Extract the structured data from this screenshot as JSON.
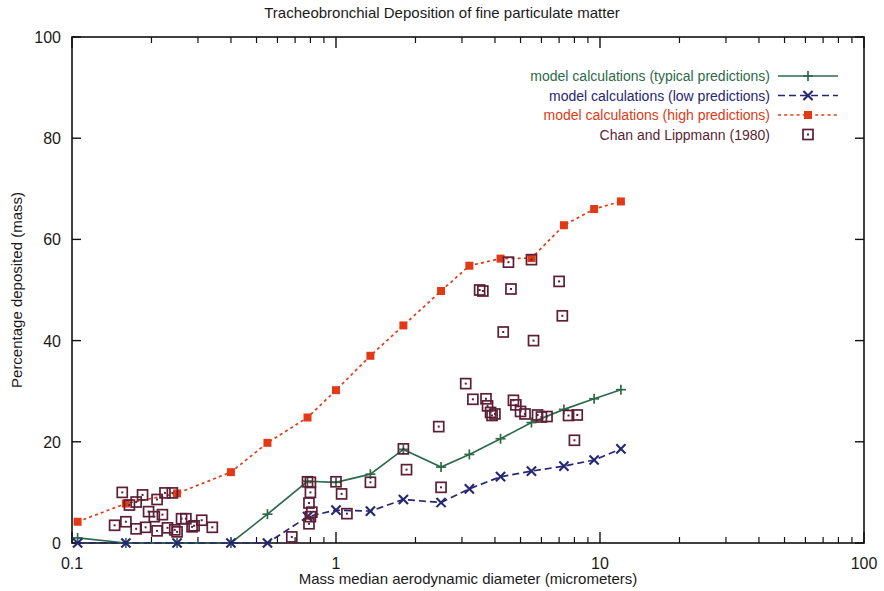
{
  "chart_data": {
    "type": "scatter",
    "title": "Tracheobronchial Deposition of fine particulate matter",
    "xlabel": "Mass median aerodynamic diameter (micrometers)",
    "ylabel": "Percentage deposited (mass)",
    "xscale": "log",
    "yscale": "linear",
    "xlim": [
      0.1,
      100
    ],
    "ylim": [
      0,
      100
    ],
    "xticks": [
      "0.1",
      "1",
      "10",
      "100"
    ],
    "xtick_values": [
      0.1,
      1,
      10,
      100
    ],
    "yticks": [
      "0",
      "20",
      "40",
      "60",
      "80",
      "100"
    ],
    "ytick_values": [
      0,
      20,
      40,
      60,
      80,
      100
    ],
    "grid": false,
    "legend_position": "top-right",
    "series": [
      {
        "name": "model calculations (typical predictions)",
        "color": "#2d6a4a",
        "style": "solid",
        "marker": "plus",
        "x": [
          0.105,
          0.16,
          0.25,
          0.4,
          0.55,
          0.78,
          1.0,
          1.35,
          1.8,
          2.5,
          3.2,
          4.2,
          5.5,
          7.3,
          9.5,
          12.0
        ],
        "y": [
          1.0,
          0.0,
          0.0,
          0.0,
          5.7,
          12.2,
          12.0,
          13.6,
          18.5,
          15.0,
          17.5,
          20.6,
          23.8,
          26.4,
          28.5,
          30.3
        ]
      },
      {
        "name": "model calculations (low predictions)",
        "color": "#262673",
        "style": "dashed",
        "marker": "cross",
        "x": [
          0.105,
          0.16,
          0.25,
          0.4,
          0.55,
          0.78,
          1.0,
          1.35,
          1.8,
          2.5,
          3.2,
          4.2,
          5.5,
          7.3,
          9.5,
          12.0
        ],
        "y": [
          0.0,
          0.0,
          0.0,
          0.0,
          0.0,
          5.2,
          6.5,
          6.3,
          8.6,
          8.0,
          10.7,
          13.1,
          14.2,
          15.2,
          16.4,
          18.6
        ]
      },
      {
        "name": "model calculations (high predictions)",
        "color": "#e03a16",
        "style": "dotted",
        "marker": "filled-square",
        "x": [
          0.105,
          0.16,
          0.25,
          0.4,
          0.55,
          0.78,
          1.0,
          1.35,
          1.8,
          2.5,
          3.2,
          4.2,
          5.5,
          7.3,
          9.5,
          12.0
        ],
        "y": [
          4.2,
          7.8,
          9.8,
          14.0,
          19.8,
          24.8,
          30.2,
          37.0,
          43.0,
          49.8,
          54.8,
          56.2,
          56.3,
          62.8,
          66.0,
          67.5
        ]
      },
      {
        "name": "Chan and Lippmann (1980)",
        "color": "#5c1f35",
        "style": "none",
        "marker": "open-square",
        "x": [
          0.155,
          0.165,
          0.175,
          0.185,
          0.195,
          0.21,
          0.225,
          0.24,
          0.145,
          0.16,
          0.175,
          0.19,
          0.21,
          0.23,
          0.25,
          0.27,
          0.29,
          0.205,
          0.22,
          0.245,
          0.26,
          0.285,
          0.31,
          0.34,
          0.78,
          0.8,
          0.8,
          0.79,
          0.81,
          0.8,
          0.79,
          1.0,
          1.05,
          1.1,
          1.35,
          1.8,
          1.85,
          2.45,
          2.5,
          3.1,
          3.3,
          3.5,
          3.6,
          3.7,
          3.75,
          3.85,
          3.9,
          4.0,
          4.3,
          4.5,
          4.6,
          4.7,
          4.8,
          5.0,
          5.2,
          5.5,
          5.6,
          5.8,
          6.0,
          6.3,
          7.0,
          7.2,
          7.6,
          8.0,
          8.2,
          0.68
        ],
        "y": [
          10.0,
          7.5,
          8.1,
          9.5,
          6.2,
          8.6,
          9.9,
          9.9,
          3.5,
          4.2,
          2.8,
          3.1,
          2.4,
          3.0,
          2.2,
          4.8,
          3.4,
          5.2,
          5.6,
          2.6,
          4.8,
          3.2,
          4.5,
          3.1,
          12.1,
          12.0,
          10.0,
          7.9,
          6.1,
          5.2,
          3.8,
          12.1,
          9.7,
          5.8,
          12.0,
          18.6,
          14.5,
          23.0,
          11.0,
          31.5,
          28.4,
          50.0,
          49.8,
          28.5,
          27.1,
          25.8,
          25.2,
          25.5,
          41.7,
          55.5,
          50.2,
          28.2,
          27.3,
          26.0,
          25.5,
          56.0,
          40.0,
          25.3,
          24.9,
          25.0,
          51.7,
          44.9,
          25.2,
          20.3,
          25.3,
          1.2
        ]
      }
    ]
  },
  "legend": {
    "items": [
      {
        "label": "model calculations (typical predictions)",
        "color": "#2d6a4a",
        "marker": "plus",
        "style": "solid"
      },
      {
        "label": "model calculations (low predictions)",
        "color": "#262673",
        "marker": "cross",
        "style": "dashed"
      },
      {
        "label": "model calculations (high predictions)",
        "color": "#e03a16",
        "marker": "filled-square",
        "style": "dotted"
      },
      {
        "label": "Chan and Lippmann (1980)",
        "color": "#5c1f35",
        "marker": "open-square",
        "style": "none"
      }
    ]
  }
}
